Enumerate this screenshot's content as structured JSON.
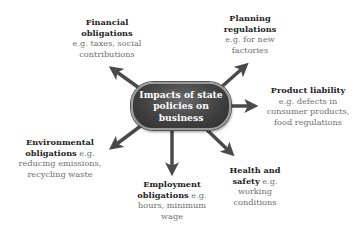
{
  "center": {
    "title": "Impacts of state policies on business"
  },
  "nodes": [
    {
      "id": "financial",
      "heading": "Financial obligations",
      "detail": "e.g. taxes, social contributions"
    },
    {
      "id": "planning",
      "heading": "Planning regulations",
      "detail": "e.g. for new factories"
    },
    {
      "id": "product",
      "heading": "Product liability",
      "detail": "e.g. defects in consumer products, food regulations"
    },
    {
      "id": "environmental",
      "heading": "Environmental obligations",
      "detail": "e.g. reducing emissions, recycling waste"
    },
    {
      "id": "employment",
      "heading": "Employment obligations",
      "detail": "e.g. hours, minimum wage"
    },
    {
      "id": "health",
      "heading": "Health and safety",
      "detail": "e.g. working conditions"
    }
  ],
  "colors": {
    "arrow": "#4a4a4a",
    "node_fill": "#3f3f3f",
    "node_border": "#9a9a9a",
    "heading_text": "#222222",
    "detail_text": "#6e6e6e"
  }
}
